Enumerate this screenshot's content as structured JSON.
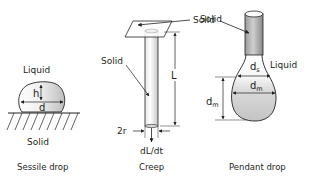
{
  "diagram": {
    "panels": [
      {
        "id": "sessile",
        "caption": "Sessile drop",
        "labels": {
          "top": "Liquid",
          "bottom": "Solid",
          "height": "h",
          "diameter": "d"
        }
      },
      {
        "id": "creep",
        "caption": "Creep",
        "labels": {
          "plate": "Solid",
          "rod": "Solid",
          "length": "L",
          "radius": "2r",
          "rate": "dL/dt"
        }
      },
      {
        "id": "pendant",
        "caption": "Pendant drop",
        "labels": {
          "rod": "Solid",
          "liquid": "Liquid",
          "ds_main": "d",
          "ds_sub": "s",
          "dm_main": "d",
          "dm_sub": "m",
          "dm_side_main": "d",
          "dm_side_sub": "m"
        }
      }
    ],
    "colors": {
      "line": "#231f20",
      "fill_light": "#f2f2f2",
      "fill_dark": "#c8c8c8"
    }
  }
}
